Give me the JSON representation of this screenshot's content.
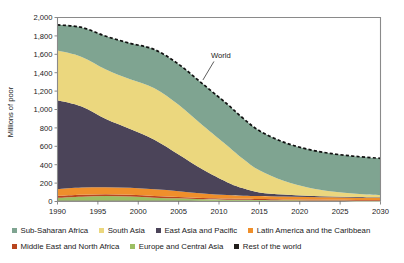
{
  "chart_data": {
    "type": "area",
    "stacked": true,
    "title": "",
    "xlabel": "",
    "ylabel": "Millions of poor",
    "x": [
      1990,
      1993,
      1996,
      1999,
      2002,
      2005,
      2008,
      2011,
      2013,
      2015,
      2018,
      2021,
      2024,
      2027,
      2030
    ],
    "xlim": [
      1990,
      2030
    ],
    "ylim": [
      0,
      2000
    ],
    "xticks": [
      "1990",
      "1995",
      "2000",
      "2005",
      "2010",
      "2015",
      "2020",
      "2025",
      "2030"
    ],
    "yticks": [
      "0",
      "200",
      "400",
      "600",
      "800",
      "1,000",
      "1,200",
      "1,400",
      "1,600",
      "1,800",
      "2,000"
    ],
    "grid": false,
    "legend_position": "bottom",
    "series": [
      {
        "name": "Rest of the world",
        "color": "#221f1c",
        "values": [
          12,
          12,
          11,
          11,
          10,
          10,
          9,
          8,
          8,
          7,
          6,
          5,
          5,
          4,
          4
        ]
      },
      {
        "name": "Europe and Central Asia",
        "color": "#9cbf63",
        "values": [
          28,
          40,
          48,
          42,
          32,
          24,
          16,
          12,
          10,
          9,
          7,
          6,
          5,
          4,
          4
        ]
      },
      {
        "name": "Middle East and North Africa",
        "color": "#b8451f",
        "values": [
          22,
          22,
          21,
          20,
          18,
          16,
          14,
          12,
          11,
          11,
          10,
          10,
          9,
          9,
          9
        ]
      },
      {
        "name": "Latin America and the Caribbean",
        "color": "#ef8f2b",
        "values": [
          72,
          78,
          76,
          76,
          72,
          62,
          48,
          38,
          34,
          32,
          30,
          28,
          26,
          25,
          24
        ]
      },
      {
        "name": "East Asia and Pacific",
        "color": "#4b4459",
        "values": [
          966,
          880,
          740,
          640,
          540,
          400,
          260,
          140,
          80,
          40,
          22,
          14,
          10,
          8,
          6
        ]
      },
      {
        "name": "South Asia",
        "color": "#ebd77e",
        "values": [
          540,
          540,
          540,
          540,
          560,
          540,
          480,
          400,
          320,
          240,
          150,
          90,
          55,
          35,
          22
        ]
      },
      {
        "name": "Sub-Saharan Africa",
        "color": "#7fa491",
        "values": [
          280,
          320,
          360,
          390,
          420,
          440,
          450,
          450,
          440,
          430,
          420,
          415,
          410,
          405,
          400
        ]
      }
    ],
    "total_line": {
      "name": "World",
      "style": "dashed",
      "color": "#111111",
      "values": [
        1920,
        1892,
        1796,
        1719,
        1652,
        1492,
        1277,
        1060,
        903,
        769,
        645,
        568,
        520,
        490,
        469
      ]
    },
    "annotations": [
      {
        "label": "World",
        "x": 2009,
        "y": 1560
      }
    ]
  }
}
